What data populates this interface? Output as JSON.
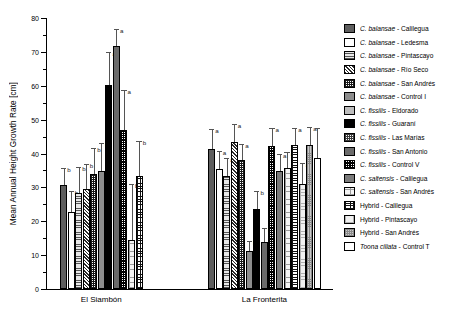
{
  "chart_data": {
    "type": "bar",
    "title": "",
    "xlabel": "",
    "ylabel": "Mean Annual Height Growth Rate [cm]",
    "ylim": [
      0,
      80
    ],
    "yticks": [
      0,
      10,
      20,
      30,
      40,
      50,
      60,
      70,
      80
    ],
    "ytick_labels": [
      "0",
      "10",
      "20",
      "30",
      "40",
      "50",
      "60",
      "70",
      "80"
    ],
    "grid": false,
    "legend_position": "right",
    "categories": [
      "El Siambón",
      "La Fronterita"
    ],
    "series": [
      {
        "name": "C. balansae - Calilegua",
        "pattern": "p-solid-dark",
        "values": [
          30.6,
          41.3
        ],
        "errors": [
          5.0,
          6.0
        ],
        "letters": [
          "b",
          "a"
        ]
      },
      {
        "name": "C. balansae - Ledesma",
        "pattern": "p-white",
        "values": [
          22.8,
          35.3
        ],
        "errors": [
          6.0,
          5.4
        ],
        "letters": [
          "b",
          "a"
        ]
      },
      {
        "name": "C. balansae - Pintascayo",
        "pattern": "p-hlines",
        "values": [
          28.2,
          33.5
        ],
        "errors": [
          7.8,
          5.2
        ],
        "letters": [
          "b",
          "a"
        ]
      },
      {
        "name": "C. balansae - Río Seco",
        "pattern": "p-diag",
        "values": [
          29.4,
          43.4
        ],
        "errors": [
          7.4,
          5.4
        ],
        "letters": [
          "b",
          "a"
        ]
      },
      {
        "name": "C. balansae - San Andrés",
        "pattern": "p-checker",
        "values": [
          33.9,
          38.1
        ],
        "errors": [
          7.8,
          4.6
        ],
        "letters": [
          "b",
          "a"
        ]
      },
      {
        "name": "C. balansae - Control I",
        "pattern": "p-midgray",
        "values": [
          34.7,
          11.2
        ],
        "errors": [
          8.3,
          3.0
        ],
        "letters": [
          "b",
          "b"
        ]
      },
      {
        "name": "C. fissilis - Eldorado",
        "pattern": "p-litegray",
        "values": [
          null,
          null
        ],
        "errors": [
          null,
          null
        ],
        "letters": [
          "",
          ""
        ]
      },
      {
        "name": "C. fissilis - Guaraní",
        "pattern": "p-black",
        "values": [
          60.1,
          23.5
        ],
        "errors": [
          9.8,
          5.5
        ],
        "letters": [
          "a",
          "b"
        ]
      },
      {
        "name": "C. fissilis - Las Marías",
        "pattern": "p-smallcheck",
        "values": [
          null,
          null
        ],
        "errors": [
          null,
          null
        ],
        "letters": [
          "",
          ""
        ]
      },
      {
        "name": "C. fissilis - San Antonio",
        "pattern": "p-darkgray",
        "values": [
          71.8,
          14.0
        ],
        "errors": [
          4.9,
          4.0
        ],
        "letters": [
          "a",
          "b"
        ]
      },
      {
        "name": "C. fissilis - Control V",
        "pattern": "p-densecheck",
        "values": [
          46.9,
          42.2
        ],
        "errors": [
          11.8,
          5.2
        ],
        "letters": [
          "a",
          "a"
        ]
      },
      {
        "name": "C. saltensis - Calilegua",
        "pattern": "p-slate",
        "values": [
          null,
          34.8
        ],
        "errors": [
          null,
          5.1
        ],
        "letters": [
          "",
          "a"
        ]
      },
      {
        "name": "C. saltensis - San Andrés",
        "pattern": "p-finedots",
        "values": [
          14.5,
          35.7
        ],
        "errors": [
          16.5,
          4.6
        ],
        "letters": [
          "b",
          "a"
        ]
      },
      {
        "name": "Hybrid - Calilegua",
        "pattern": "p-grid",
        "values": [
          33.4,
          42.4
        ],
        "errors": [
          10.3,
          5.1
        ],
        "letters": [
          "b",
          "a"
        ]
      },
      {
        "name": "Hybrid - Pintascayo",
        "pattern": "p-litegrid",
        "values": [
          null,
          31.0
        ],
        "errors": [
          null,
          6.2
        ],
        "letters": [
          "",
          "a"
        ]
      },
      {
        "name": "Hybrid - San Andrés",
        "pattern": "p-stipple",
        "values": [
          null,
          42.5
        ],
        "errors": [
          null,
          5.4
        ],
        "letters": [
          "",
          "a"
        ]
      },
      {
        "name": "Toona ciliata - Control T",
        "pattern": "p-plainwhite",
        "values": [
          null,
          38.6
        ],
        "errors": [
          null,
          9.0
        ],
        "letters": [
          "",
          ""
        ]
      }
    ]
  },
  "legend": {
    "items": [
      {
        "label": "C. balansae - Calilegua",
        "italic": "C. balansae",
        "rest": " - Calilegua",
        "pattern": "p-solid-dark"
      },
      {
        "label": "C. balansae - Ledesma",
        "italic": "C. balansae",
        "rest": " - Ledesma",
        "pattern": "p-white"
      },
      {
        "label": "C. balansae - Pintascayo",
        "italic": "C. balansae",
        "rest": " - Pintascayo",
        "pattern": "p-hlines"
      },
      {
        "label": "C. balansae - Río Seco",
        "italic": "C. balansae",
        "rest": " - Río Seco",
        "pattern": "p-diag"
      },
      {
        "label": "C. balansae - San Andrés",
        "italic": "C. balansae",
        "rest": " - San Andrés",
        "pattern": "p-checker"
      },
      {
        "label": "C. balansae - Control I",
        "italic": "C. balansae",
        "rest": " - Control I",
        "pattern": "p-midgray"
      },
      {
        "label": "C. fissilis - Eldorado",
        "italic": "C. fissilis",
        "rest": " - Eldorado",
        "pattern": "p-litegray"
      },
      {
        "label": "C. fissilis - Guaraní",
        "italic": "C. fissilis",
        "rest": " - Guaraní",
        "pattern": "p-black"
      },
      {
        "label": "C. fissilis - Las Marías",
        "italic": "C. fissilis",
        "rest": " - Las Marías",
        "pattern": "p-smallcheck"
      },
      {
        "label": "C. fissilis - San Antonio",
        "italic": "C. fissilis",
        "rest": " - San Antonio",
        "pattern": "p-darkgray"
      },
      {
        "label": "C. fissilis - Control V",
        "italic": "C. fissilis",
        "rest": " - Control V",
        "pattern": "p-densecheck"
      },
      {
        "label": "C. saltensis - Calilegua",
        "italic": "C. saltensis",
        "rest": " - Calilegua",
        "pattern": "p-slate"
      },
      {
        "label": "C. saltensis - San Andrés",
        "italic": "C. saltensis",
        "rest": " - San Andrés",
        "pattern": "p-finedots"
      },
      {
        "label": "Hybrid - Calilegua",
        "italic": "",
        "rest": "Hybrid - Calilegua",
        "pattern": "p-grid"
      },
      {
        "label": "Hybrid - Pintascayo",
        "italic": "",
        "rest": "Hybrid - Pintascayo",
        "pattern": "p-litegrid"
      },
      {
        "label": "Hybrid - San Andrés",
        "italic": "",
        "rest": "Hybrid - San Andrés",
        "pattern": "p-stipple"
      },
      {
        "label": "Toona ciliata - Control T",
        "italic": "Toona ciliata",
        "rest": " - Control T",
        "pattern": "p-plainwhite"
      }
    ]
  }
}
